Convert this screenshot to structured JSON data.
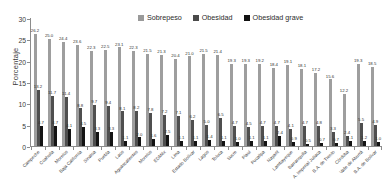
{
  "chart_data": {
    "type": "bar",
    "title": "",
    "xlabel": "",
    "ylabel": "Porcentaje",
    "ylim": [
      0,
      30
    ],
    "yticks": [
      0,
      5,
      10,
      15,
      20,
      25,
      30
    ],
    "grid": false,
    "legend_position": "top-center",
    "categories": [
      "Campeche",
      "Coahuila",
      "Morelos",
      "Baja California",
      "Sinaloa",
      "Puebla",
      "Laos",
      "Aguascalientes",
      "Morelos",
      "EDMéx",
      "Lima",
      "Estado Bolívar",
      "Lagos",
      "Toluca",
      "Sucre",
      "Piauí",
      "Pucallpa",
      "Nayarit",
      "Lambayeque",
      "Barranquilla",
      "A. Imperial Juliaca",
      "B.A. de Trento",
      "Córdoba",
      "Valle de Aburrá",
      "B.A. de Bolívar"
    ],
    "series": [
      {
        "name": "Sobrepeso",
        "color": "#9e9e9e",
        "values": [
          26.2,
          25.0,
          24.4,
          23.6,
          22.3,
          22.5,
          23.1,
          22.3,
          21.5,
          21.3,
          20.4,
          21.0,
          21.5,
          21.4,
          19.3,
          19.3,
          19.2,
          18.4,
          19.1,
          18.1,
          17.2,
          15.6,
          12.2,
          19.3,
          18.5
        ]
      },
      {
        "name": "Obesidad",
        "color": "#4f4f4f",
        "values": [
          13.2,
          11.7,
          11.4,
          8.8,
          9.7,
          9.4,
          8.1,
          8.2,
          7.8,
          7.2,
          7.1,
          6.2,
          5.0,
          6.5,
          4.7,
          4.5,
          4.7,
          4.7,
          4.1,
          4.7,
          4.8,
          3.3,
          2.4,
          5.5,
          4.9
        ]
      },
      {
        "name": "Obesidad grave",
        "color": "#141414",
        "values": [
          4.7,
          4.7,
          4.1,
          4.5,
          3.3,
          3.3,
          1.1,
          2.0,
          1.6,
          2.5,
          1.1,
          1.1,
          1.4,
          1.1,
          1.0,
          1.1,
          1.1,
          2.4,
          0.9,
          0.5,
          0.7,
          0.7,
          1.1,
          1.2,
          1.0
        ]
      }
    ]
  },
  "legend": {
    "items": [
      {
        "label": "Sobrepeso"
      },
      {
        "label": "Obesidad"
      },
      {
        "label": "Obesidad grave"
      }
    ]
  }
}
